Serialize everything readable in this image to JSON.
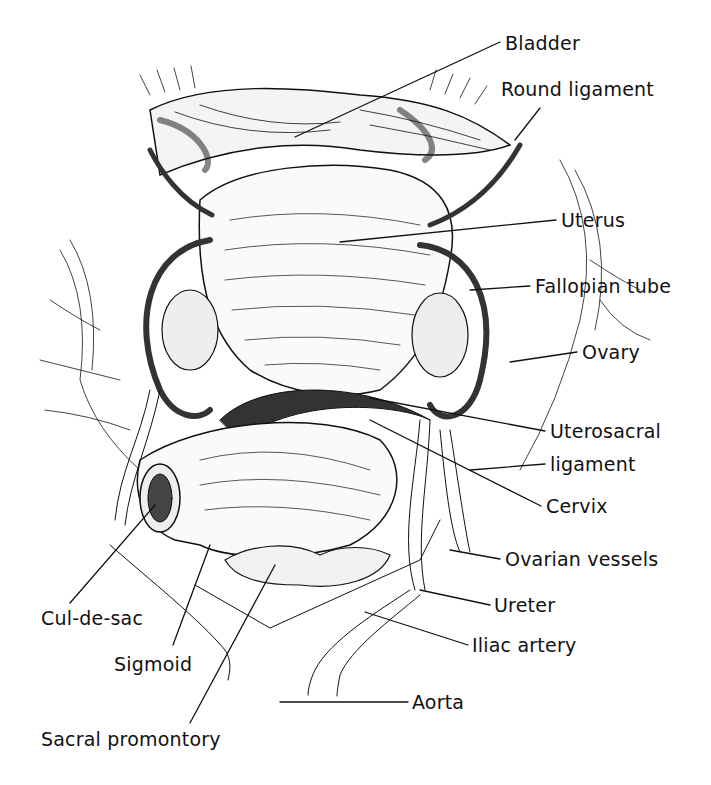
{
  "figure": {
    "type": "anatomical illustration",
    "background": "#ffffff",
    "ink_color": "#111111"
  },
  "labels": [
    {
      "id": "bladder",
      "text": "Bladder",
      "x": 505,
      "y": 34
    },
    {
      "id": "round-ligament",
      "text": "Round ligament",
      "x": 501,
      "y": 80
    },
    {
      "id": "uterus",
      "text": "Uterus",
      "x": 561,
      "y": 211
    },
    {
      "id": "fallopian-tube",
      "text": "Fallopian tube",
      "x": 535,
      "y": 277
    },
    {
      "id": "ovary",
      "text": "Ovary",
      "x": 582,
      "y": 343
    },
    {
      "id": "uterosacral-ligament",
      "text": "Uterosacral",
      "x": 550,
      "y": 422
    },
    {
      "id": "uterosacral-ligament-2",
      "text": "ligament",
      "x": 550,
      "y": 455
    },
    {
      "id": "cervix",
      "text": "Cervix",
      "x": 546,
      "y": 497
    },
    {
      "id": "ovarian-vessels",
      "text": "Ovarian vessels",
      "x": 505,
      "y": 550
    },
    {
      "id": "ureter",
      "text": "Ureter",
      "x": 494,
      "y": 596
    },
    {
      "id": "iliac-artery",
      "text": "Iliac artery",
      "x": 472,
      "y": 636
    },
    {
      "id": "aorta",
      "text": "Aorta",
      "x": 412,
      "y": 669
    },
    {
      "id": "cul-de-sac",
      "text": "Cul-de-sac",
      "x": 41,
      "y": 597
    },
    {
      "id": "sigmoid",
      "text": "Sigmoid",
      "x": 114,
      "y": 644
    },
    {
      "id": "sacral-promontory",
      "text": "Sacral promontory",
      "x": 41,
      "y": 738
    }
  ]
}
